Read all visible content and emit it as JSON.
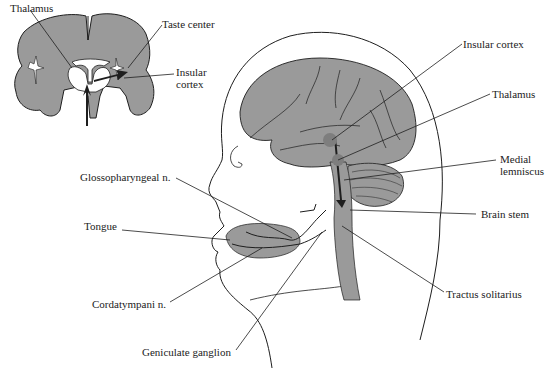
{
  "colors": {
    "tissue": "#9a9a9a",
    "tissue_light": "#b8b8b8",
    "outline": "#1e1e1e",
    "background": "#ffffff",
    "label_text": "#222222"
  },
  "inset": {
    "title": "coronal-brain-section",
    "labels": {
      "thalamus": "Thalamus",
      "taste_center": "Taste center",
      "insular_cortex_line1": "Insular",
      "insular_cortex_line2": "cortex"
    }
  },
  "head": {
    "labels": {
      "insular_cortex": "Insular cortex",
      "thalamus": "Thalamus",
      "medial_lemniscus_line1": "Medial",
      "medial_lemniscus_line2": "lemniscus",
      "brain_stem": "Brain stem",
      "tractus_solitarius": "Tractus solitarius",
      "glossopharyngeal": "Glossopharyngeal n.",
      "tongue": "Tongue",
      "cordatympani": "Cordatympani n.",
      "geniculate_ganglion": "Geniculate ganglion"
    }
  }
}
